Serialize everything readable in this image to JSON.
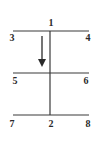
{
  "diagram": {
    "type": "node-line-diagram",
    "stroke_color": "#3a3a3a",
    "nodes": [
      {
        "id": "1",
        "label": "1",
        "x": 51,
        "y": 23
      },
      {
        "id": "3",
        "label": "3",
        "x": 12,
        "y": 38
      },
      {
        "id": "4",
        "label": "4",
        "x": 88,
        "y": 38
      },
      {
        "id": "5",
        "label": "5",
        "x": 15,
        "y": 81
      },
      {
        "id": "6",
        "label": "6",
        "x": 86,
        "y": 81
      },
      {
        "id": "7",
        "label": "7",
        "x": 12,
        "y": 124
      },
      {
        "id": "2",
        "label": "2",
        "x": 51,
        "y": 124
      },
      {
        "id": "8",
        "label": "8",
        "x": 88,
        "y": 124
      }
    ],
    "lines": [
      {
        "name": "top-horizontal",
        "from": "3",
        "to": "4"
      },
      {
        "name": "middle-horizontal",
        "from": "5",
        "to": "6"
      },
      {
        "name": "bottom-horizontal",
        "from": "7",
        "to": "8"
      },
      {
        "name": "vertical-center",
        "from": "1",
        "to": "2"
      }
    ],
    "arrow": {
      "direction": "down",
      "meaning": "downward-arrow"
    }
  }
}
